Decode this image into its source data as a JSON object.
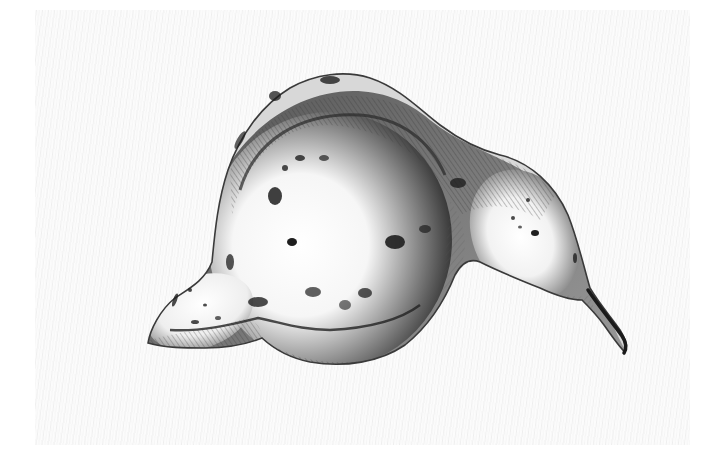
{
  "image": {
    "subject": "pencil sketch of a gourd-shaped tuber (yam)",
    "alt": "Graphite pencil drawing of a lumpy gourd-like tuber with dark speckles, a pointed left tip and a thin curved stem on the right",
    "colors": {
      "background": "#ffffff",
      "paper_texture": "#f3f3f3",
      "shade_dark": "#2a2a2a",
      "shade_mid": "#8a8a8a",
      "highlight": "#fbfbfb",
      "speckle": "#1e1e1e"
    }
  }
}
